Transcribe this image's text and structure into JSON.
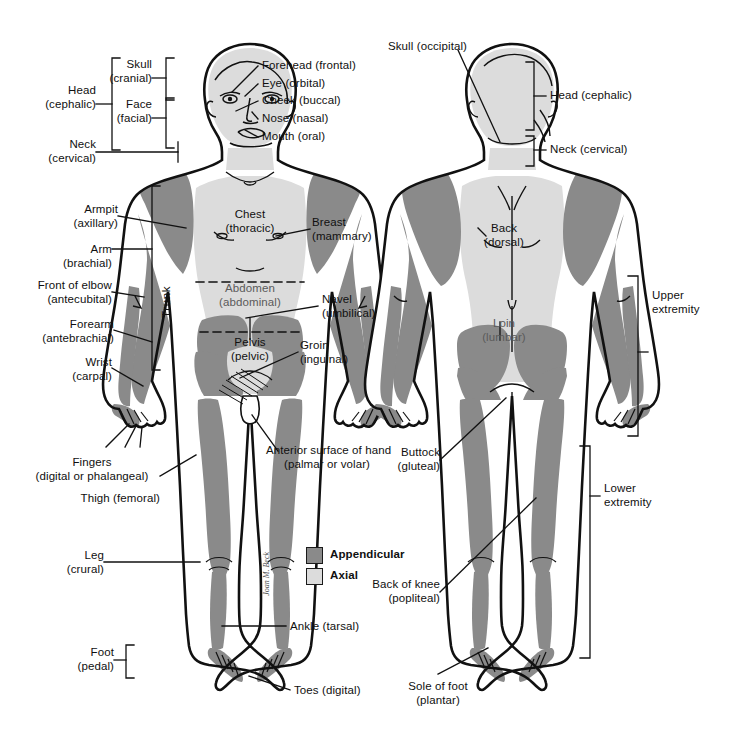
{
  "diagram": {
    "colors": {
      "appendicular": "#8a8a8a",
      "axial": "#dcdcdc",
      "outline": "#111111",
      "background": "#ffffff",
      "label_text": "#101010"
    },
    "signature": "Joan M. Beck"
  },
  "legend": {
    "items": [
      {
        "label": "Appendicular",
        "swatch": "#8a8a8a"
      },
      {
        "label": "Axial",
        "swatch": "#dcdcdc"
      }
    ]
  },
  "anterior": {
    "view_name": "anterior-view",
    "labels": {
      "head": "Head\n(cephalic)",
      "skull": "Skull\n(cranial)",
      "face": "Face\n(facial)",
      "neck": "Neck\n(cervical)",
      "forehead": "Forehead (frontal)",
      "eye": "Eye (orbital)",
      "cheek": "Cheek (buccal)",
      "nose": "Nose (nasal)",
      "mouth": "Mouth (oral)",
      "armpit": "Armpit\n(axillary)",
      "arm": "Arm\n(brachial)",
      "front_of_elbow": "Front of elbow\n(antecubital)",
      "forearm": "Forearm\n(antebrachial)",
      "wrist": "Wrist\n(carpal)",
      "fingers": "Fingers\n(digital or phalangeal)",
      "thigh": "Thigh (femoral)",
      "leg": "Leg\n(crural)",
      "foot": "Foot\n(pedal)",
      "chest": "Chest\n(thoracic)",
      "abdomen": "Abdomen\n(abdominal)",
      "pelvis": "Pelvis\n(pelvic)",
      "trunk": "Trunk",
      "breast": "Breast\n(mammary)",
      "navel": "Navel\n(umbilical)",
      "groin": "Groin\n(inguinal)",
      "hand_anterior": "Anterior surface of hand\n(palmar or volar)",
      "ankle": "Ankle (tarsal)",
      "toes": "Toes (digital)"
    }
  },
  "posterior": {
    "view_name": "posterior-view",
    "labels": {
      "skull": "Skull (occipital)",
      "head": "Head (cephalic)",
      "neck": "Neck (cervical)",
      "back": "Back\n(dorsal)",
      "loin": "Loin\n(lumbar)",
      "buttock": "Buttock\n(gluteal)",
      "back_of_knee": "Back of knee\n(popliteal)",
      "sole_of_foot": "Sole of foot\n(plantar)",
      "upper_extremity": "Upper\nextremity",
      "lower_extremity": "Lower\nextremity"
    }
  }
}
